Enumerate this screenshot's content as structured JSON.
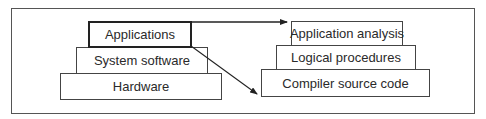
{
  "diagram": {
    "left_stack": [
      {
        "label": "Applications",
        "highlighted": true
      },
      {
        "label": "System software",
        "highlighted": false
      },
      {
        "label": "Hardware",
        "highlighted": false
      }
    ],
    "right_stack": [
      {
        "label": "Application analysis"
      },
      {
        "label": "Logical procedures"
      },
      {
        "label": "Compiler source code"
      }
    ],
    "arrows": [
      {
        "from": "Applications",
        "to": "Application analysis"
      },
      {
        "from": "Applications",
        "to": "Compiler source code"
      }
    ],
    "colors": {
      "stroke": "#333333",
      "background": "#ffffff"
    }
  }
}
